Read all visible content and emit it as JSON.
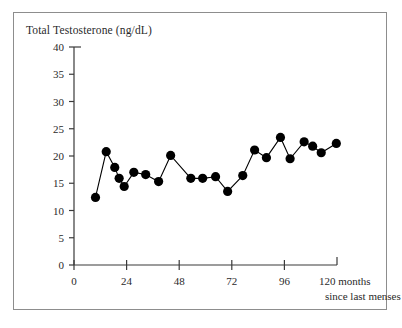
{
  "figure": {
    "background_color": "#ffffff",
    "border_color": "#8d8d8d",
    "marker_color": "#000000",
    "line_color": "#000000",
    "axis_color": "#3a3a3a"
  },
  "chart_data": {
    "type": "line",
    "title": "Total Testosterone (ng/dL)",
    "xlabel": "months since last menses",
    "xlabel_line1": "120 months",
    "xlabel_line2": "since last menses",
    "ylabel": "Total Testosterone (ng/dL)",
    "xlim": [
      0,
      120
    ],
    "ylim": [
      0,
      40
    ],
    "grid": false,
    "legend": "none",
    "marker": "filled-circle",
    "xticks": [
      0,
      24,
      48,
      72,
      96,
      120
    ],
    "xtick_labels": [
      "0",
      "24",
      "48",
      "72",
      "96",
      "120"
    ],
    "yticks": [
      0,
      5,
      10,
      15,
      20,
      25,
      30,
      35,
      40
    ],
    "ytick_labels": [
      "0",
      "5",
      "10",
      "15",
      "20",
      "25",
      "30",
      "35",
      "40"
    ],
    "series": [
      {
        "name": "Total Testosterone",
        "x": [
          9.8,
          14.7,
          18.6,
          20.6,
          22.9,
          27.3,
          32.7,
          38.6,
          44.1,
          53.3,
          58.7,
          64.6,
          70.1,
          77.0,
          82.4,
          87.8,
          94.2,
          98.6,
          105.0,
          108.9,
          112.8,
          119.7
        ],
        "y": [
          12.4,
          20.8,
          17.9,
          15.9,
          14.4,
          17.0,
          16.6,
          15.3,
          20.1,
          15.9,
          15.9,
          16.2,
          13.5,
          16.4,
          21.1,
          19.7,
          23.4,
          19.5,
          22.6,
          21.8,
          20.6,
          22.3
        ]
      }
    ]
  }
}
